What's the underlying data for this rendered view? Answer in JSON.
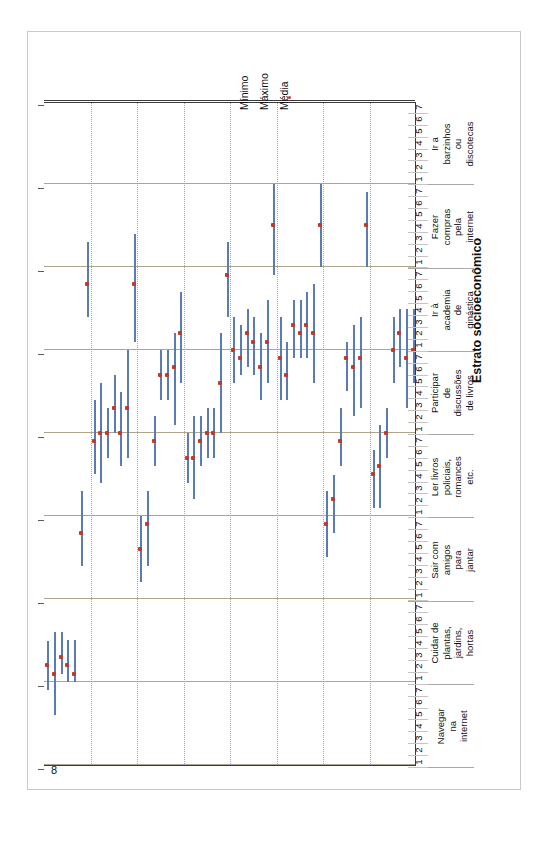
{
  "panel": {
    "label": "Painel B"
  },
  "legend": {
    "items": [
      {
        "name": "minimo",
        "label": "Mínimo",
        "marker": "line",
        "color": "#5b7bb4"
      },
      {
        "name": "maximo",
        "label": "Máximo",
        "marker": "line",
        "color": "#5b7bb4"
      },
      {
        "name": "media",
        "label": "Média",
        "marker": "dot",
        "color": "#C0392B"
      }
    ]
  },
  "chart_data": {
    "type": "bar",
    "subtitle": "",
    "xlabel": "Estrato socioeconômico",
    "ylabel": "Resposta",
    "ylim": [
      0,
      8
    ],
    "yticks": [
      8,
      7,
      6,
      5,
      4,
      3,
      2,
      1,
      0
    ],
    "grid": true,
    "legend_position": "top",
    "x_axis_direction": "reversed",
    "strata_labels": [
      "1",
      "2",
      "3",
      "4",
      "5",
      "6",
      "7"
    ],
    "categories": [
      "Navegar na internet",
      "Cuidar de plantas, jardins, hortas",
      "Sair com amigos para jantar",
      "Ler livros policiais, romances etc.",
      "Participar de discussões de livros",
      "Ir à academia de ginástica",
      "Fazer compras pela internet",
      "Ir a barzinhos ou discotecas"
    ],
    "series": [
      {
        "name": "Mínimo",
        "color": "#5b7bb4"
      },
      {
        "name": "Máximo",
        "color": "#5b7bb4"
      },
      {
        "name": "Média",
        "color": "#C0392B"
      }
    ],
    "groups": [
      {
        "category": "Navegar na internet",
        "points": [
          {
            "strata": "1",
            "min": 6.5,
            "max": 7.1,
            "mean": 6.8
          },
          {
            "strata": "2",
            "min": 6.4,
            "max": 7.4,
            "mean": 6.9
          },
          {
            "strata": "3",
            "min": 6.4,
            "max": 6.9,
            "mean": 6.7
          },
          {
            "strata": "4",
            "min": 6.5,
            "max": 7.0,
            "mean": 6.8
          },
          {
            "strata": "5",
            "min": 6.5,
            "max": 7.0,
            "mean": 6.9
          },
          {
            "strata": "6",
            "min": 4.7,
            "max": 5.6,
            "mean": 5.2
          },
          {
            "strata": "7",
            "min": 1.7,
            "max": 2.6,
            "mean": 2.2
          }
        ]
      },
      {
        "category": "Cuidar de plantas, jardins, hortas",
        "points": [
          {
            "strata": "1",
            "min": 3.6,
            "max": 4.5,
            "mean": 4.1
          },
          {
            "strata": "2",
            "min": 3.4,
            "max": 4.6,
            "mean": 4.0
          },
          {
            "strata": "3",
            "min": 3.7,
            "max": 4.3,
            "mean": 4.0
          },
          {
            "strata": "4",
            "min": 3.3,
            "max": 4.0,
            "mean": 3.7
          },
          {
            "strata": "5",
            "min": 3.5,
            "max": 4.4,
            "mean": 4.0
          },
          {
            "strata": "6",
            "min": 3.0,
            "max": 4.3,
            "mean": 3.7
          },
          {
            "strata": "7",
            "min": 1.6,
            "max": 2.9,
            "mean": 2.2
          }
        ]
      },
      {
        "category": "Sair com amigos para jantar",
        "points": [
          {
            "strata": "1",
            "min": 5.0,
            "max": 5.8,
            "mean": 5.4
          },
          {
            "strata": "2",
            "min": 4.7,
            "max": 5.6,
            "mean": 5.1
          },
          {
            "strata": "3",
            "min": 3.8,
            "max": 4.4,
            "mean": 4.1
          },
          {
            "strata": "4",
            "min": 3.0,
            "max": 3.6,
            "mean": 3.3
          },
          {
            "strata": "5",
            "min": 3.0,
            "max": 3.6,
            "mean": 3.3
          },
          {
            "strata": "6",
            "min": 2.8,
            "max": 3.9,
            "mean": 3.2
          },
          {
            "strata": "7",
            "min": 2.3,
            "max": 3.4,
            "mean": 2.8
          }
        ]
      },
      {
        "category": "Ler livros policiais, romances etc.",
        "points": [
          {
            "strata": "1",
            "min": 4.0,
            "max": 4.6,
            "mean": 4.3
          },
          {
            "strata": "2",
            "min": 3.8,
            "max": 4.8,
            "mean": 4.3
          },
          {
            "strata": "3",
            "min": 3.8,
            "max": 4.4,
            "mean": 4.1
          },
          {
            "strata": "4",
            "min": 3.7,
            "max": 4.3,
            "mean": 4.0
          },
          {
            "strata": "5",
            "min": 3.7,
            "max": 4.3,
            "mean": 4.0
          },
          {
            "strata": "6",
            "min": 2.8,
            "max": 4.0,
            "mean": 3.4
          },
          {
            "strata": "7",
            "min": 1.7,
            "max": 2.6,
            "mean": 2.1
          }
        ]
      },
      {
        "category": "Participar de discussões de livros",
        "points": [
          {
            "strata": "1",
            "min": 2.6,
            "max": 3.4,
            "mean": 3.0
          },
          {
            "strata": "2",
            "min": 2.7,
            "max": 3.3,
            "mean": 3.1
          },
          {
            "strata": "3",
            "min": 2.5,
            "max": 3.2,
            "mean": 2.8
          },
          {
            "strata": "4",
            "min": 2.6,
            "max": 3.3,
            "mean": 2.9
          },
          {
            "strata": "5",
            "min": 2.8,
            "max": 3.6,
            "mean": 3.2
          },
          {
            "strata": "6",
            "min": 2.4,
            "max": 3.4,
            "mean": 2.9
          },
          {
            "strata": "7",
            "min": 1.0,
            "max": 2.1,
            "mean": 1.5
          }
        ]
      },
      {
        "category": "Ir à academia de ginástica",
        "points": [
          {
            "strata": "1",
            "min": 2.6,
            "max": 3.6,
            "mean": 3.1
          },
          {
            "strata": "2",
            "min": 2.9,
            "max": 3.6,
            "mean": 3.3
          },
          {
            "strata": "3",
            "min": 2.4,
            "max": 3.1,
            "mean": 2.7
          },
          {
            "strata": "4",
            "min": 2.4,
            "max": 3.1,
            "mean": 2.8
          },
          {
            "strata": "5",
            "min": 2.3,
            "max": 3.1,
            "mean": 2.7
          },
          {
            "strata": "6",
            "min": 2.2,
            "max": 3.4,
            "mean": 2.8
          },
          {
            "strata": "7",
            "min": 1.0,
            "max": 2.0,
            "mean": 1.5
          }
        ]
      },
      {
        "category": "Fazer compras pela internet",
        "points": [
          {
            "strata": "1",
            "min": 4.7,
            "max": 5.5,
            "mean": 5.1
          },
          {
            "strata": "2",
            "min": 4.5,
            "max": 5.2,
            "mean": 4.8
          },
          {
            "strata": "3",
            "min": 3.7,
            "max": 4.4,
            "mean": 4.1
          },
          {
            "strata": "4",
            "min": 2.9,
            "max": 3.5,
            "mean": 3.1
          },
          {
            "strata": "5",
            "min": 2.7,
            "max": 3.8,
            "mean": 3.2
          },
          {
            "strata": "6",
            "min": 2.6,
            "max": 3.7,
            "mean": 3.1
          },
          {
            "strata": "7",
            "min": 1.1,
            "max": 2.0,
            "mean": 1.5
          }
        ]
      },
      {
        "category": "Ir a barzinhos ou discotecas",
        "points": [
          {
            "strata": "1",
            "min": 4.2,
            "max": 4.9,
            "mean": 4.5
          },
          {
            "strata": "2",
            "min": 3.9,
            "max": 4.9,
            "mean": 4.4
          },
          {
            "strata": "3",
            "min": 3.7,
            "max": 4.3,
            "mean": 4.0
          },
          {
            "strata": "4",
            "min": 2.6,
            "max": 3.4,
            "mean": 3.0
          },
          {
            "strata": "5",
            "min": 2.5,
            "max": 3.2,
            "mean": 2.8
          },
          {
            "strata": "6",
            "min": 2.5,
            "max": 3.7,
            "mean": 3.1
          },
          {
            "strata": "7",
            "min": 2.5,
            "max": 3.4,
            "mean": 3.0
          }
        ]
      }
    ]
  }
}
